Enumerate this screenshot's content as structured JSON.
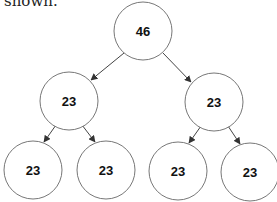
{
  "caption": "shown.",
  "tree": {
    "nodes": [
      {
        "id": "root",
        "value": "46",
        "cx": 143,
        "cy": 31
      },
      {
        "id": "l",
        "value": "23",
        "cx": 69,
        "cy": 101
      },
      {
        "id": "r",
        "value": "23",
        "cx": 214,
        "cy": 102
      },
      {
        "id": "ll",
        "value": "23",
        "cx": 33,
        "cy": 170
      },
      {
        "id": "lr",
        "value": "23",
        "cx": 106,
        "cy": 170
      },
      {
        "id": "rl",
        "value": "23",
        "cx": 178,
        "cy": 171
      },
      {
        "id": "rr",
        "value": "23",
        "cx": 250,
        "cy": 172
      }
    ],
    "edges": [
      [
        "root",
        "l"
      ],
      [
        "root",
        "r"
      ],
      [
        "l",
        "ll"
      ],
      [
        "l",
        "lr"
      ],
      [
        "r",
        "rl"
      ],
      [
        "r",
        "rr"
      ]
    ]
  }
}
